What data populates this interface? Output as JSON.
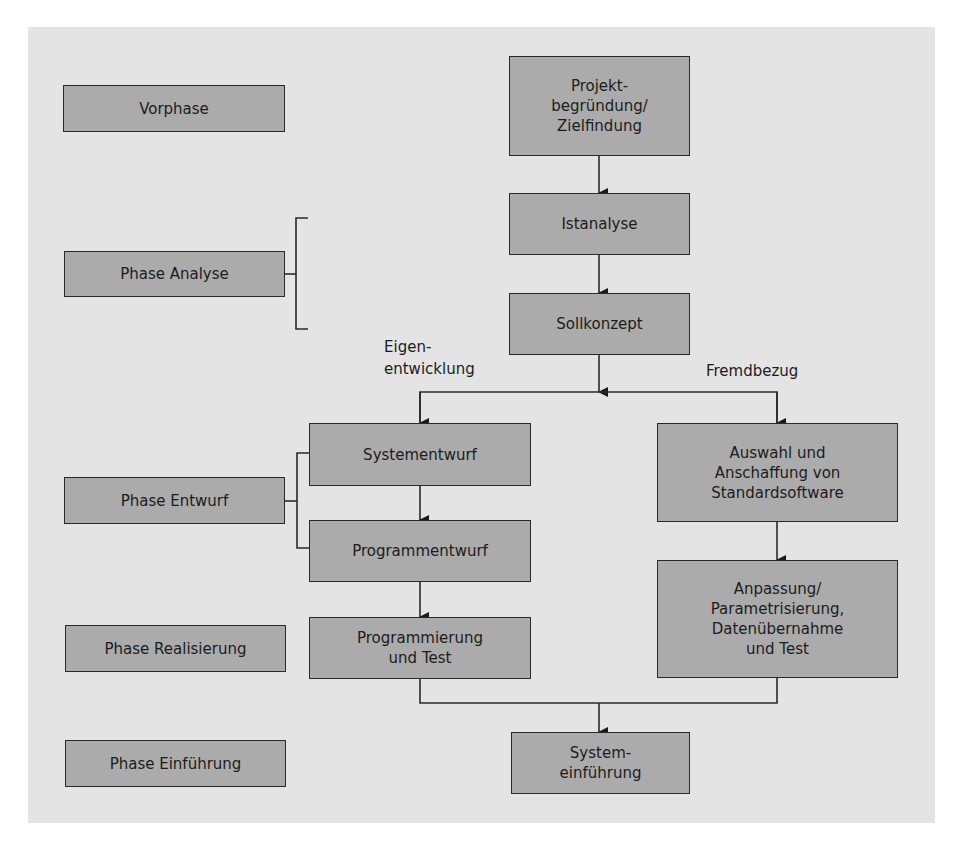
{
  "phases": {
    "vorphase": "Vorphase",
    "analyse": "Phase Analyse",
    "entwurf": "Phase Entwurf",
    "realisierung": "Phase Realisierung",
    "einfuehrung": "Phase Einführung"
  },
  "steps": {
    "projektbegruendung": "Projekt-\nbegründung/\nZielfindung",
    "istanalyse": "Istanalyse",
    "sollkonzept": "Sollkonzept",
    "systementwurf": "Systementwurf",
    "programmentwurf": "Programmentwurf",
    "programmierung": "Programmierung\nund Test",
    "auswahl": "Auswahl und\nAnschaffung von\nStandardsoftware",
    "anpassung": "Anpassung/\nParametrisierung,\nDatenübernahme\nund Test",
    "systemeinfuehrung": "System-\neinführung"
  },
  "branches": {
    "left": "Eigen-\nentwicklung",
    "right": "Fremdbezug"
  },
  "colors": {
    "background": "#e4e4e4",
    "box_fill": "#ababab",
    "line": "#2a2a2a"
  }
}
